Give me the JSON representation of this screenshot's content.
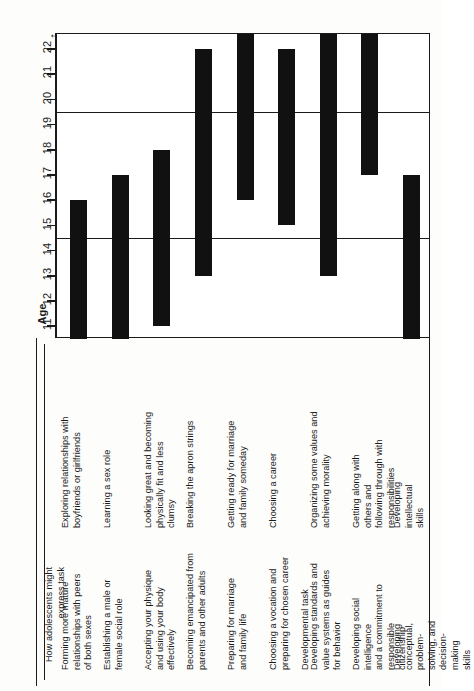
{
  "chart_data": {
    "type": "bar",
    "orientation": "vertical-range",
    "title": "",
    "xlabel": "",
    "ylabel": "Age",
    "ylim": [
      10.5,
      22.6
    ],
    "axis_arrow": "↑",
    "grid": true,
    "gridlines": [
      14.5,
      19.5
    ],
    "tick_labels": [
      "11",
      "12",
      "13",
      "14",
      "15",
      "16",
      "17",
      "18",
      "19",
      "20",
      "21",
      "22"
    ],
    "tick_values": [
      11,
      12,
      13,
      14,
      15,
      16,
      17,
      18,
      19,
      20,
      21,
      22
    ],
    "categories": [
      "Forming more mature relationships with peers of both sexes",
      "Establishing a male or female social role",
      "Accepting your physique and using your body effectively",
      "Becoming emancipated from parents and other adults",
      "Preparing for marriage and family life",
      "Choosing a vocation and preparing for chosen career",
      "Developing standards and value systems as guides for behavior",
      "Developing social intelligence and a commitment to responsible citizenship",
      "Developing conceptual, problem-solving, and decision-making skills"
    ],
    "bars": [
      {
        "index": 1,
        "start": 10.5,
        "end": 16.0
      },
      {
        "index": 2,
        "start": 10.5,
        "end": 17.0
      },
      {
        "index": 3,
        "start": 11.0,
        "end": 18.0
      },
      {
        "index": 4,
        "start": 13.0,
        "end": 22.0
      },
      {
        "index": 5,
        "start": 16.0,
        "end": 22.6
      },
      {
        "index": 6,
        "start": 15.0,
        "end": 22.0
      },
      {
        "index": 7,
        "start": 13.0,
        "end": 22.6
      },
      {
        "index": 8,
        "start": 17.0,
        "end": 22.6
      },
      {
        "index": 9,
        "start": 10.5,
        "end": 17.0
      }
    ]
  },
  "axis": {
    "label": "Age",
    "arrow": "↑",
    "ticks": [
      "11",
      "12",
      "13",
      "14",
      "15",
      "16",
      "17",
      "18",
      "19",
      "20",
      "21",
      "22"
    ]
  },
  "table": {
    "headers": {
      "col1": "Developmental task",
      "col2": "How adolescents might\nexpress task"
    },
    "rows": [
      {
        "task": "Forming more mature\nrelationships with peers\nof both sexes",
        "expression": "Exploring relationships with\nboyfriends or girlfriends"
      },
      {
        "task": "Establishing a male or\nfemale social role",
        "expression": "Learning a sex role"
      },
      {
        "task": "Accepting your physique\nand using your body\neffectively",
        "expression": "Looking great and becoming\nphysically fit and less\nclumsy"
      },
      {
        "task": "Becoming emancipated from\nparents and other adults",
        "expression": "Breaking the apron strings"
      },
      {
        "task": "Preparing for marriage\nand family life",
        "expression": "Getting ready for marriage\nand family someday"
      },
      {
        "task": "Choosing a vocation and\npreparing for chosen career",
        "expression": "Choosing a career"
      },
      {
        "task": "Developing standards and\nvalue systems as guides\nfor behavior",
        "expression": "Organizing some values and\nachieving morality"
      },
      {
        "task": "Developing social intelligence\nand a commitment to\nresponsible citizenship",
        "expression": "Getting along with others and\nfollowing through with\nresponsibilities"
      },
      {
        "task": "Developing conceptual,\nproblem-solving, and decision-\nmaking skills",
        "expression": "Developing intellectual\nskills"
      }
    ]
  },
  "colors": {
    "bar": "#111111",
    "axis": "#1a1a1a",
    "background": "#fdfdfc"
  }
}
